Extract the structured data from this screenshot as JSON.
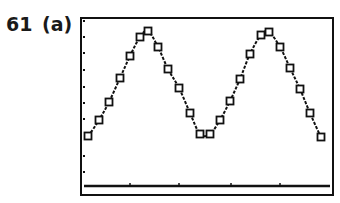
{
  "figure": {
    "problem_number": "61",
    "part_label": "(a)"
  },
  "colors": {
    "ink": "#111111",
    "background": "#ffffff"
  },
  "chart_data": {
    "type": "scatter",
    "title": "",
    "xlabel": "",
    "ylabel": "",
    "grid": false,
    "legend": null,
    "frame_px": {
      "left": 81,
      "top": 18,
      "right": 333,
      "bottom": 195
    },
    "x_axis_px_y": 186,
    "x_tick_px": [
      130,
      179,
      231,
      280
    ],
    "y_tick_dot_px": [
      21,
      37,
      53,
      70,
      87,
      103,
      119,
      156,
      172
    ],
    "points_px": [
      [
        88,
        136
      ],
      [
        99,
        120
      ],
      [
        109,
        102
      ],
      [
        120,
        78
      ],
      [
        130,
        56
      ],
      [
        140,
        37
      ],
      [
        148,
        31
      ],
      [
        158,
        47
      ],
      [
        168,
        69
      ],
      [
        179,
        88
      ],
      [
        190,
        113
      ],
      [
        200,
        134
      ],
      [
        210,
        134
      ],
      [
        220,
        120
      ],
      [
        230,
        101
      ],
      [
        240,
        79
      ],
      [
        250,
        54
      ],
      [
        261,
        35
      ],
      [
        269,
        32
      ],
      [
        280,
        47
      ],
      [
        290,
        68
      ],
      [
        300,
        89
      ],
      [
        310,
        113
      ],
      [
        321,
        137
      ]
    ],
    "series": [
      {
        "name": "data",
        "marker": "square",
        "x": [
          1,
          2,
          3,
          4,
          5,
          6,
          7,
          8,
          9,
          10,
          11,
          12,
          13,
          14,
          15,
          16,
          17,
          18,
          19,
          20,
          21,
          22,
          23,
          24
        ],
        "values": [
          136,
          120,
          102,
          78,
          56,
          37,
          31,
          47,
          69,
          88,
          113,
          134,
          134,
          120,
          101,
          79,
          54,
          35,
          32,
          47,
          68,
          89,
          113,
          137
        ]
      },
      {
        "name": "sinusoidal fit",
        "marker": "none",
        "style": "dotted-line"
      }
    ],
    "y_values_note": "values are pixel y-coordinates (smaller = higher on screen); axis has no numeric labels"
  }
}
